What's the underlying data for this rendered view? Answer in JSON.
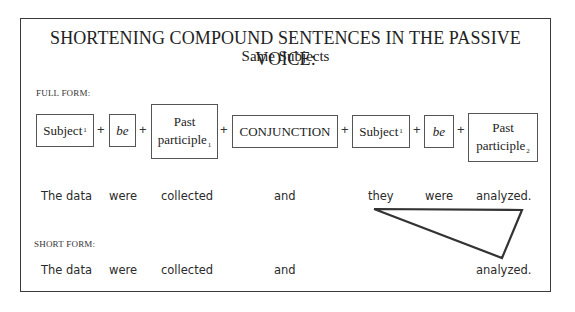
{
  "title": "SHORTENING COMPOUND SENTENCES IN THE PASSIVE VOICE:",
  "subtitle": "Same Subjects",
  "full_form": {
    "label": "FULL FORM:",
    "formula": [
      {
        "type": "box",
        "text": "Subject",
        "sub": "1",
        "italic": false
      },
      {
        "type": "plus",
        "text": "+"
      },
      {
        "type": "box",
        "text": "be",
        "sub": "",
        "italic": true
      },
      {
        "type": "plus",
        "text": "+"
      },
      {
        "type": "box",
        "text_line1": "Past",
        "text_line2": "participle",
        "sub": "1"
      },
      {
        "type": "plus",
        "text": "+"
      },
      {
        "type": "box",
        "text": "CONJUNCTION",
        "sub": ""
      },
      {
        "type": "plus",
        "text": "+"
      },
      {
        "type": "box",
        "text": "Subject",
        "sub": "1",
        "italic": false
      },
      {
        "type": "plus",
        "text": "+"
      },
      {
        "type": "box",
        "text": "be",
        "sub": "",
        "italic": true
      },
      {
        "type": "plus",
        "text": "+"
      },
      {
        "type": "box",
        "text_line1": "Past",
        "text_line2": "participle",
        "sub": "2"
      }
    ],
    "example": [
      "The data",
      "were",
      "collected",
      "and",
      "they",
      "were",
      "analyzed."
    ]
  },
  "short_form": {
    "label": "SHORT FORM:",
    "example": [
      "The data",
      "were",
      "collected",
      "and",
      "analyzed."
    ]
  },
  "annotation": {
    "shape": "triangle",
    "description": "deletion mark linking 'they were' to shortened form"
  }
}
